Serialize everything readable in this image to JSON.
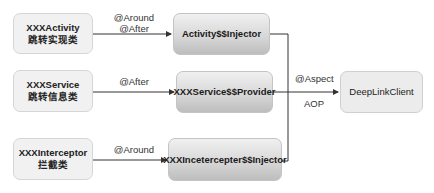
{
  "diagram": {
    "sources": [
      {
        "name": "XXXActivity",
        "desc": "跳转实现类"
      },
      {
        "name": "XXXService",
        "desc": "跳转信息类"
      },
      {
        "name": "XXXInterceptor",
        "desc": "拦截类"
      }
    ],
    "generated": [
      {
        "name": "Activity$$Injector"
      },
      {
        "name": "XXXService$$Provider"
      },
      {
        "name": "XXXIncetercepter$$Injector"
      }
    ],
    "edges": [
      {
        "label_line1": "@Around",
        "label_line2": "@After"
      },
      {
        "label_line1": "@After"
      },
      {
        "label_line1": "@Around"
      }
    ],
    "aspect": {
      "label_top": "@Aspect",
      "label_bottom": "AOP"
    },
    "target": {
      "name": "DeepLinkClient"
    }
  },
  "colors": {
    "line": "#333333",
    "source_fill": "#f1f1f1",
    "generated_fill_top": "#f0f0f0",
    "generated_fill_bottom": "#bdbdbd",
    "target_fill": "#ececec"
  }
}
